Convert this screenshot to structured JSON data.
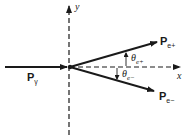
{
  "diagram": {
    "type": "pair-production momentum diagram",
    "axes": {
      "x_label": "x",
      "y_label": "y"
    },
    "vectors": [
      {
        "label": "P",
        "subscript": "γ",
        "description": "incoming photon momentum"
      },
      {
        "label": "P",
        "subscript": "e+",
        "description": "positron momentum"
      },
      {
        "label": "P",
        "subscript": "e−",
        "description": "electron momentum"
      }
    ],
    "angles": [
      {
        "symbol": "θ",
        "subscript": "e+"
      },
      {
        "symbol": "θ",
        "subscript": "e−"
      }
    ]
  }
}
